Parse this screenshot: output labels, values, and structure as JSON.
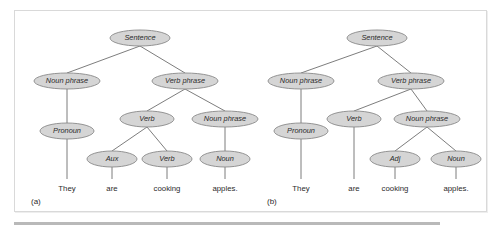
{
  "figure": {
    "background_color": "#ffffff",
    "frame_border_color": "#d9d9d9",
    "node_fill_color": "#d5d5d5",
    "node_stroke_color": "#8a8a8a",
    "edge_color": "#6e6e6e",
    "text_color": "#2b2b2b",
    "rule_color": "#b9b9b9"
  },
  "panels": [
    {
      "caption": "(a)",
      "sentence": "They are cooking apples.",
      "nodes": [
        {
          "id": "a-sentence",
          "label": "Sentence",
          "cx": 125,
          "cy": 27,
          "rx": 30,
          "ry": 8
        },
        {
          "id": "a-np1",
          "label": "Noun phrase",
          "cx": 52,
          "cy": 70,
          "rx": 33,
          "ry": 8
        },
        {
          "id": "a-vp",
          "label": "Verb phrase",
          "cx": 170,
          "cy": 70,
          "rx": 33,
          "ry": 8
        },
        {
          "id": "a-pronoun",
          "label": "Pronoun",
          "cx": 52,
          "cy": 120,
          "rx": 27,
          "ry": 8
        },
        {
          "id": "a-verb1",
          "label": "Verb",
          "cx": 132,
          "cy": 108,
          "rx": 27,
          "ry": 8
        },
        {
          "id": "a-np2",
          "label": "Noun phrase",
          "cx": 210,
          "cy": 108,
          "rx": 33,
          "ry": 8
        },
        {
          "id": "a-aux",
          "label": "Aux",
          "cx": 97,
          "cy": 148,
          "rx": 25,
          "ry": 8
        },
        {
          "id": "a-verb2",
          "label": "Verb",
          "cx": 152,
          "cy": 148,
          "rx": 25,
          "ry": 8
        },
        {
          "id": "a-noun",
          "label": "Noun",
          "cx": 210,
          "cy": 148,
          "rx": 25,
          "ry": 8
        }
      ],
      "edges": [
        {
          "from": "a-sentence",
          "to": "a-np1"
        },
        {
          "from": "a-sentence",
          "to": "a-vp"
        },
        {
          "from": "a-np1",
          "to": "a-pronoun"
        },
        {
          "from": "a-vp",
          "to": "a-verb1"
        },
        {
          "from": "a-vp",
          "to": "a-np2"
        },
        {
          "from": "a-verb1",
          "to": "a-aux"
        },
        {
          "from": "a-verb1",
          "to": "a-verb2"
        },
        {
          "from": "a-np2",
          "to": "a-noun"
        }
      ],
      "terminals": [
        {
          "word": "They",
          "x": 52,
          "y": 178,
          "parent": "a-pronoun"
        },
        {
          "word": "are",
          "x": 97,
          "y": 178,
          "parent": "a-aux"
        },
        {
          "word": "cooking",
          "x": 152,
          "y": 178,
          "parent": "a-verb2"
        },
        {
          "word": "apples.",
          "x": 210,
          "y": 178,
          "parent": "a-noun"
        }
      ]
    },
    {
      "caption": "(b)",
      "sentence": "They are cooking apples.",
      "nodes": [
        {
          "id": "b-sentence",
          "label": "Sentence",
          "cx": 126,
          "cy": 27,
          "rx": 30,
          "ry": 8
        },
        {
          "id": "b-np1",
          "label": "Noun phrase",
          "cx": 50,
          "cy": 70,
          "rx": 33,
          "ry": 8
        },
        {
          "id": "b-vp",
          "label": "Verb phrase",
          "cx": 160,
          "cy": 70,
          "rx": 33,
          "ry": 8
        },
        {
          "id": "b-pronoun",
          "label": "Pronoun",
          "cx": 50,
          "cy": 120,
          "rx": 27,
          "ry": 8
        },
        {
          "id": "b-verb",
          "label": "Verb",
          "cx": 103,
          "cy": 108,
          "rx": 27,
          "ry": 8
        },
        {
          "id": "b-np2",
          "label": "Noun phrase",
          "cx": 176,
          "cy": 108,
          "rx": 33,
          "ry": 8
        },
        {
          "id": "b-adj",
          "label": "Adj",
          "cx": 144,
          "cy": 148,
          "rx": 25,
          "ry": 8
        },
        {
          "id": "b-noun",
          "label": "Noun",
          "cx": 205,
          "cy": 148,
          "rx": 25,
          "ry": 8
        }
      ],
      "edges": [
        {
          "from": "b-sentence",
          "to": "b-np1"
        },
        {
          "from": "b-sentence",
          "to": "b-vp"
        },
        {
          "from": "b-np1",
          "to": "b-pronoun"
        },
        {
          "from": "b-vp",
          "to": "b-verb"
        },
        {
          "from": "b-vp",
          "to": "b-np2"
        },
        {
          "from": "b-np2",
          "to": "b-adj"
        },
        {
          "from": "b-np2",
          "to": "b-noun"
        }
      ],
      "terminals": [
        {
          "word": "They",
          "x": 50,
          "y": 178,
          "parent": "b-pronoun"
        },
        {
          "word": "are",
          "x": 103,
          "y": 178,
          "parent": "b-verb"
        },
        {
          "word": "cooking",
          "x": 144,
          "y": 178,
          "parent": "b-adj"
        },
        {
          "word": "apples.",
          "x": 205,
          "y": 178,
          "parent": "b-noun"
        }
      ]
    }
  ]
}
